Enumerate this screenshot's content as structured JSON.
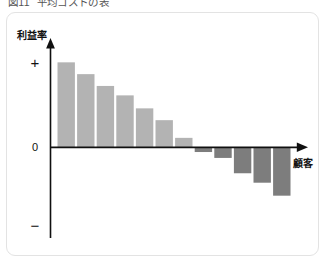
{
  "caption": {
    "number": "図11",
    "text": "平均コストの表"
  },
  "chart_data": {
    "type": "bar",
    "title": "",
    "xlabel": "顧客",
    "ylabel": "利益率",
    "grid": false,
    "legend": null,
    "ylim": [
      -1.0,
      1.0
    ],
    "ytick_labels": [
      "+",
      "0",
      "−"
    ],
    "ytick_values": [
      0.78,
      0,
      -0.78
    ],
    "categories": [
      "1",
      "2",
      "3",
      "4",
      "5",
      "6",
      "7",
      "8",
      "9",
      "10",
      "11",
      "12"
    ],
    "values": [
      0.72,
      0.62,
      0.52,
      0.44,
      0.33,
      0.23,
      0.08,
      -0.04,
      -0.09,
      -0.22,
      -0.3,
      -0.41
    ],
    "colors": {
      "positive": "#b3b3b3",
      "negative": "#7d7d7d",
      "axis": "#101010",
      "card_border": "#e3e3e3",
      "background": "#ffffff"
    }
  },
  "icons": {
    "y_axis_arrow": "arrow-up-icon",
    "x_axis_arrow": "arrow-right-icon"
  }
}
